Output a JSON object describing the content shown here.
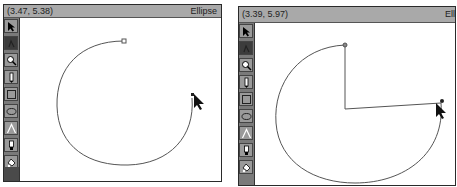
{
  "windows": [
    {
      "id": "left",
      "titlebar": {
        "coordinates": "(3.47, 5.38)",
        "mode": "Ellipse"
      },
      "toolbar": {
        "tools": [
          {
            "name": "arrow-tool",
            "icon": "arrow-icon",
            "active": false
          },
          {
            "name": "rotate-tool",
            "icon": "rotate-icon",
            "active": true
          },
          {
            "name": "zoom-tool",
            "icon": "magnifier-icon",
            "active": false
          },
          {
            "name": "pen-tool",
            "icon": "pen-icon",
            "active": false
          },
          {
            "name": "rectangle-tool",
            "icon": "rectangle-icon",
            "active": false
          },
          {
            "name": "ellipse-tool",
            "icon": "ellipse-icon",
            "active": false
          },
          {
            "name": "line-tool",
            "icon": "angle-line-icon",
            "active": false
          },
          {
            "name": "fill-tool",
            "icon": "paint-tube-icon",
            "active": false
          },
          {
            "name": "bucket-tool",
            "icon": "paint-bucket-icon",
            "active": false
          }
        ]
      },
      "drawing": {
        "shape": "elliptical-arc",
        "closed": false
      }
    },
    {
      "id": "right",
      "titlebar": {
        "coordinates": "(3.39, 5.97)",
        "mode": "Ell"
      },
      "toolbar": {
        "tools": [
          {
            "name": "arrow-tool",
            "icon": "arrow-icon",
            "active": false
          },
          {
            "name": "rotate-tool",
            "icon": "rotate-icon",
            "active": true
          },
          {
            "name": "zoom-tool",
            "icon": "magnifier-icon",
            "active": false
          },
          {
            "name": "pen-tool",
            "icon": "pen-icon",
            "active": false
          },
          {
            "name": "rectangle-tool",
            "icon": "rectangle-icon",
            "active": false
          },
          {
            "name": "ellipse-tool",
            "icon": "ellipse-icon",
            "active": false
          },
          {
            "name": "line-tool",
            "icon": "angle-line-icon",
            "active": false
          },
          {
            "name": "fill-tool",
            "icon": "paint-tube-icon",
            "active": false
          },
          {
            "name": "bucket-tool",
            "icon": "paint-bucket-icon",
            "active": false
          }
        ]
      },
      "drawing": {
        "shape": "pie-wedge",
        "closed": true
      }
    }
  ]
}
